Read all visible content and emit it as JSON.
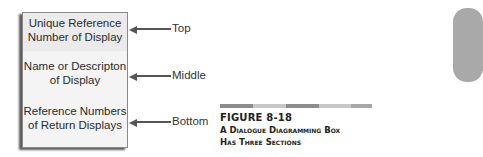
{
  "diagram": {
    "box": {
      "sections": [
        {
          "text_line1": "Unique Reference",
          "text_line2": "Number of Display"
        },
        {
          "text_line1": "Name or Descripton",
          "text_line2": "of Display"
        },
        {
          "text_line1": "Reference Numbers",
          "text_line2": "of Return Displays"
        }
      ]
    },
    "labels": {
      "top": "Top",
      "middle": "Middle",
      "bottom": "Bottom"
    }
  },
  "figure": {
    "number": "FIGURE 8-18",
    "caption_line1": "A Dialogue Diagramming Box",
    "caption_line2": "Has Three Sections"
  },
  "colors": {
    "bar_dark": "#8c8c8c",
    "bar_light": "#c8c8c8",
    "tab": "#a9a9a9"
  }
}
